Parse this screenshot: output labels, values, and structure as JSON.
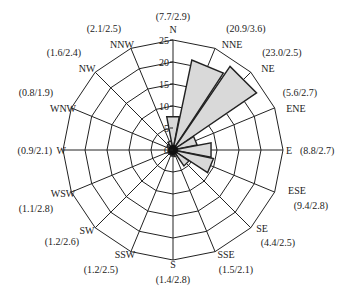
{
  "chart_data": {
    "type": "wind-rose",
    "title": "",
    "value_format": "(frequency% / mean speed m/s)",
    "radial_axis": {
      "min": 0,
      "max": 25,
      "ticks": [
        0,
        5,
        10,
        15,
        20,
        25
      ]
    },
    "directions": [
      "N",
      "NNE",
      "NE",
      "ENE",
      "E",
      "ESE",
      "SE",
      "SSE",
      "S",
      "SSW",
      "SW",
      "WSW",
      "W",
      "WNW",
      "NW",
      "NNW"
    ],
    "frequency": [
      7.7,
      20.9,
      23.0,
      5.6,
      8.8,
      9.4,
      4.4,
      1.5,
      1.4,
      1.2,
      1.2,
      1.1,
      0.9,
      0.8,
      1.6,
      2.1
    ],
    "speed": [
      2.9,
      3.6,
      2.5,
      2.7,
      2.7,
      2.8,
      2.5,
      2.1,
      2.8,
      2.5,
      2.6,
      2.8,
      2.1,
      1.9,
      2.4,
      2.5
    ],
    "labels": [
      "(7.7/2.9)",
      "(20.9/3.6)",
      "(23.0/2.5)",
      "(5.6/2.7)",
      "(8.8/2.7)",
      "(9.4/2.8)",
      "(4.4/2.5)",
      "(1.5/2.1)",
      "(1.4/2.8)",
      "(1.2/2.5)",
      "(1.2/2.6)",
      "(1.1/2.8)",
      "(0.9/2.1)",
      "(0.8/1.9)",
      "(1.6/2.4)",
      "(2.1/2.5)"
    ],
    "grid": true,
    "fill_color": "#d9d9d9",
    "line_color": "#222222"
  }
}
